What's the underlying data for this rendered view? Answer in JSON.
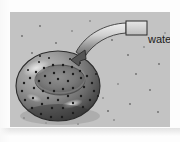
{
  "figure": {
    "kind": "scientific-illustration",
    "panel": {
      "background_color": "#c3c3c3",
      "x": 10,
      "y": 12,
      "width": 160,
      "height": 115
    }
  },
  "callout": {
    "label": "water",
    "label_color": "#1b1b1b",
    "box": {
      "x": 116,
      "y": 9,
      "width": 21,
      "height": 14,
      "stroke": "#2a2a2a"
    },
    "ribbon": {
      "fill_light": "#e2e2e2",
      "fill_dark": "#6f6f6f",
      "stroke": "#3a3a3a",
      "arrowhead_tip_x": 67,
      "arrowhead_tip_y": 48
    }
  },
  "bowl": {
    "name": "speckled-bowl",
    "center_x": 48,
    "center_y": 74,
    "radius_x": 42,
    "radius_y": 35,
    "body_light": "#b9b9b9",
    "body_mid": "#8a8a8a",
    "body_dark": "#4a4a4a",
    "outline": "#2b2b2b",
    "speckle_color": "#1c1c1c",
    "speckle_count": 52,
    "highlight_color": "#d8d8d8"
  },
  "background_specks": {
    "color": "#6a6a6a",
    "count": 22
  }
}
